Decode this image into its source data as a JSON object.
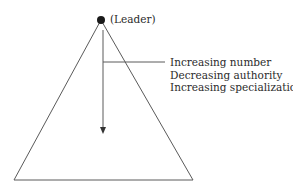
{
  "diagram": {
    "type": "hierarchy-pyramid",
    "apex_label": "(Leader)",
    "descriptors": [
      "Increasing number",
      "Decreasing authority",
      "Increasing specialization"
    ],
    "colors": {
      "line": "#555555",
      "dot": "#1a1a1a",
      "text": "#2b2b2b"
    }
  }
}
